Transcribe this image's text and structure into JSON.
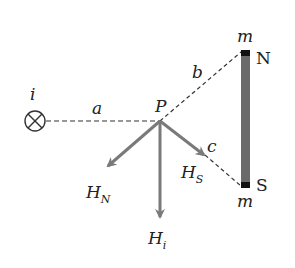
{
  "diagram": {
    "labels": {
      "current": "i",
      "dist_a": "a",
      "dist_b": "b",
      "dist_c": "c",
      "point": "P",
      "north": "N",
      "south": "S",
      "pole_mass_top": "m",
      "pole_mass_bottom": "m"
    },
    "vectors": [
      {
        "name": "H",
        "sub": "N"
      },
      {
        "name": "H",
        "sub": "i"
      },
      {
        "name": "H",
        "sub": "S"
      }
    ],
    "colors": {
      "arrow": "#7a7a7a",
      "magnet": "#6a6a6a",
      "pole": "#111111",
      "line": "#333333"
    }
  }
}
